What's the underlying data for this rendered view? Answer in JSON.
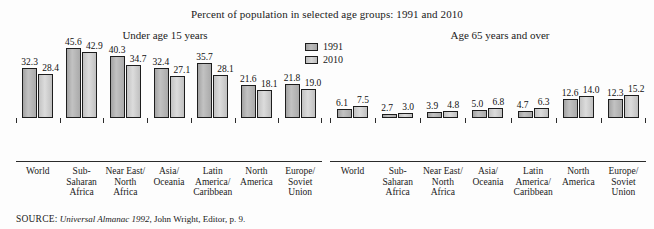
{
  "title": "Percent of population in selected age groups: 1991 and 2010",
  "subtitles": {
    "left": "Under age 15 years",
    "right": "Age 65 years and over"
  },
  "legend": {
    "items": [
      {
        "label": "1991",
        "color": "#b5b5b5"
      },
      {
        "label": "2010",
        "color": "#d2d2d2"
      }
    ]
  },
  "source": {
    "label": "SOURCE:",
    "italic": "Universal Almanac 1992",
    "rest": ", John Wright, Editor, p. 9."
  },
  "chart_data": [
    {
      "type": "bar",
      "title": "Under age 15 years",
      "categories": [
        "World",
        "Sub-Saharan Africa",
        "Near East/North Africa",
        "Asia/Oceania",
        "Latin America/Caribbean",
        "North America",
        "Europe/Soviet Union"
      ],
      "category_lines": [
        [
          "World"
        ],
        [
          "Sub-",
          "Saharan",
          "Africa"
        ],
        [
          "Near East/",
          "North",
          "Africa"
        ],
        [
          "Asia/",
          "Oceania"
        ],
        [
          "Latin",
          "America/",
          "Caribbean"
        ],
        [
          "North",
          "America"
        ],
        [
          "Europe/",
          "Soviet",
          "Union"
        ]
      ],
      "series": [
        {
          "name": "1991",
          "values": [
            32.3,
            45.6,
            40.3,
            32.4,
            35.7,
            21.6,
            21.8
          ]
        },
        {
          "name": "2010",
          "values": [
            28.4,
            42.9,
            34.7,
            27.1,
            28.1,
            18.1,
            19.0
          ]
        }
      ],
      "xlabel": "",
      "ylabel": "",
      "ylim": [
        0,
        48
      ],
      "grid": false,
      "legend_position": "top-center"
    },
    {
      "type": "bar",
      "title": "Age 65 years and over",
      "categories": [
        "World",
        "Sub-Saharan Africa",
        "Near East/North Africa",
        "Asia/Oceania",
        "Latin America/Caribbean",
        "North America",
        "Europe/Soviet Union"
      ],
      "category_lines": [
        [
          "World"
        ],
        [
          "Sub-",
          "Saharan",
          "Africa"
        ],
        [
          "Near East/",
          "North",
          "Africa"
        ],
        [
          "Asia/",
          "Oceania"
        ],
        [
          "Latin",
          "America/",
          "Caribbean"
        ],
        [
          "North",
          "America"
        ],
        [
          "Europe/",
          "Soviet",
          "Union"
        ]
      ],
      "series": [
        {
          "name": "1991",
          "values": [
            6.1,
            2.7,
            3.9,
            5.0,
            4.7,
            12.6,
            12.3
          ]
        },
        {
          "name": "2010",
          "values": [
            7.5,
            3.0,
            4.8,
            6.8,
            6.3,
            14.0,
            15.2
          ]
        }
      ],
      "xlabel": "",
      "ylabel": "",
      "ylim": [
        0,
        48
      ],
      "grid": false,
      "legend_position": "top-center"
    }
  ]
}
